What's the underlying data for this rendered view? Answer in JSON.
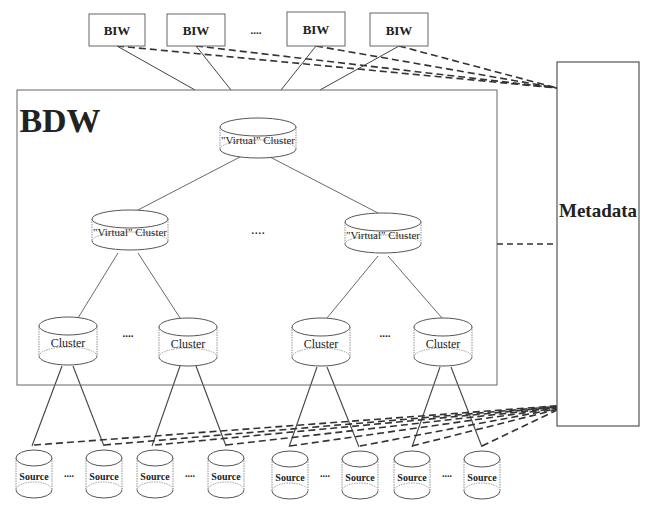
{
  "diagram": {
    "biw_nodes": [
      {
        "label": "BIW",
        "x": 89,
        "y": 14,
        "w": 56,
        "h": 32
      },
      {
        "label": "BIW",
        "x": 167,
        "y": 14,
        "w": 58,
        "h": 32
      },
      {
        "label": "BIW",
        "x": 287,
        "y": 12,
        "w": 58,
        "h": 34
      },
      {
        "label": "BIW",
        "x": 370,
        "y": 13,
        "w": 58,
        "h": 33
      }
    ],
    "biw_ellipsis": "....",
    "bdw": {
      "label": "BDW",
      "x": 17,
      "y": 90,
      "w": 480,
      "h": 295
    },
    "metadata": {
      "label": "Metadata",
      "x": 557,
      "y": 62,
      "w": 82,
      "h": 364
    },
    "virtual_clusters": [
      {
        "label": "\"Virtual\" Cluster",
        "cx": 258,
        "cy": 138
      },
      {
        "label": "\"Virtual\" Cluster",
        "cx": 130,
        "cy": 230
      },
      {
        "label": "\"Virtual\" Cluster",
        "cx": 383,
        "cy": 233
      }
    ],
    "virtual_ellipsis": "....",
    "clusters": [
      {
        "label": "Cluster",
        "cx": 68,
        "cy": 341
      },
      {
        "label": "Cluster",
        "cx": 188,
        "cy": 342
      },
      {
        "label": "Cluster",
        "cx": 321,
        "cy": 342
      },
      {
        "label": "Cluster",
        "cx": 443,
        "cy": 342
      }
    ],
    "cluster_ellipsis": "....",
    "sources": [
      {
        "label": "Source",
        "cx": 34,
        "cy": 474
      },
      {
        "label": "Source",
        "cx": 104,
        "cy": 474
      },
      {
        "label": "Source",
        "cx": 155,
        "cy": 474
      },
      {
        "label": "Source",
        "cx": 226,
        "cy": 474
      },
      {
        "label": "Source",
        "cx": 290,
        "cy": 475
      },
      {
        "label": "Source",
        "cx": 360,
        "cy": 475
      },
      {
        "label": "Source",
        "cx": 412,
        "cy": 475
      },
      {
        "label": "Source",
        "cx": 482,
        "cy": 475
      }
    ],
    "source_ellipsis": "....",
    "colors": {
      "line": "#444444",
      "dash": "#333333",
      "box": "#555555",
      "text": "#222222"
    }
  }
}
